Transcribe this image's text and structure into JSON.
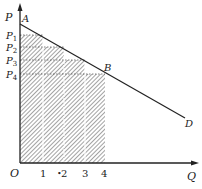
{
  "diagram": {
    "type": "demand-curve-consumer-surplus",
    "axes": {
      "y_label": "P",
      "x_label": "Q",
      "origin_label": "O"
    },
    "price_labels": [
      {
        "main": "P",
        "sub": "1"
      },
      {
        "main": "P",
        "sub": "2"
      },
      {
        "main": "P",
        "sub": "3"
      },
      {
        "main": "P",
        "sub": "4"
      }
    ],
    "quantity_ticks": [
      "1",
      "2",
      "3",
      "4"
    ],
    "curve_points": {
      "A": "A",
      "B": "B",
      "D": "D"
    },
    "bars": [
      {
        "q_from": 0,
        "q_to": 1,
        "price": "P1"
      },
      {
        "q_from": 1,
        "q_to": 2,
        "price": "P2"
      },
      {
        "q_from": 2,
        "q_to": 3,
        "price": "P3"
      },
      {
        "q_from": 3,
        "q_to": 4,
        "price": "P4"
      }
    ],
    "colors": {
      "line": "#222222",
      "hatch": "#444444"
    }
  }
}
